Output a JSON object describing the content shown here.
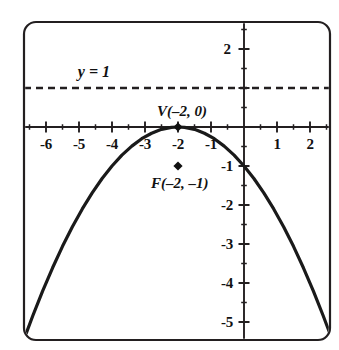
{
  "figure": {
    "title": "",
    "frame": {
      "x": 24,
      "y": 22,
      "width": 306,
      "height": 318,
      "radius": 12,
      "stroke": "#231f20",
      "stroke_width": 2.2
    },
    "background": "#ffffff"
  },
  "axes": {
    "origin_px": {
      "x": 244,
      "y": 127
    },
    "x_unit_px": 33,
    "y_unit_px": 39,
    "x_axis_label": "",
    "y_axis_label": "",
    "stroke": "#231f20"
  },
  "x_ticks": [
    {
      "value": -6,
      "label": "-6"
    },
    {
      "value": -5,
      "label": "-5"
    },
    {
      "value": -4,
      "label": "-4"
    },
    {
      "value": -3,
      "label": "-3"
    },
    {
      "value": -2,
      "label": "-2"
    },
    {
      "value": -1,
      "label": "-1"
    },
    {
      "value": 1,
      "label": "1"
    },
    {
      "value": 2,
      "label": "2"
    }
  ],
  "y_ticks": [
    {
      "value": 2,
      "label": "2"
    },
    {
      "value": 1,
      "label": ""
    },
    {
      "value": -1,
      "label": "-1"
    },
    {
      "value": -2,
      "label": "-2"
    },
    {
      "value": -3,
      "label": "-3"
    },
    {
      "value": -4,
      "label": "-4"
    },
    {
      "value": -5,
      "label": "-5"
    }
  ],
  "annotations": {
    "vertex_label": "V(–2, 0)",
    "focus_label": "F(–2, –1)",
    "directrix_label": "y = 1"
  },
  "chart_data": {
    "type": "line",
    "title": "",
    "xlabel": "",
    "ylabel": "",
    "xlim": [
      -6.7,
      2.6
    ],
    "ylim": [
      -5.5,
      2.4
    ],
    "grid": false,
    "legend": "none",
    "series": [
      {
        "name": "parabola",
        "equation": "y = -(x + 2)^2 / 4",
        "style": "solid",
        "color": "#1a1a1a",
        "width": 3.2,
        "x": [
          -6.7,
          -6.4,
          -6.1,
          -5.8,
          -5.5,
          -5.2,
          -4.9,
          -4.6,
          -4.3,
          -4.0,
          -3.7,
          -3.4,
          -3.1,
          -2.8,
          -2.5,
          -2.2,
          -2.0,
          -1.8,
          -1.5,
          -1.2,
          -0.9,
          -0.6,
          -0.3,
          0.0,
          0.3,
          0.6,
          0.9,
          1.2,
          1.5,
          1.8,
          2.1,
          2.4,
          2.6
        ],
        "y": [
          -5.52,
          -4.84,
          -4.2,
          -3.61,
          -3.06,
          -2.56,
          -2.1,
          -1.69,
          -1.32,
          -1.0,
          -0.72,
          -0.49,
          -0.3,
          -0.16,
          -0.06,
          -0.01,
          0.0,
          -0.01,
          -0.06,
          -0.16,
          -0.3,
          -0.49,
          -0.72,
          -1.0,
          -1.32,
          -1.69,
          -2.1,
          -2.56,
          -3.06,
          -3.61,
          -4.2,
          -4.84,
          -5.29
        ]
      },
      {
        "name": "directrix",
        "equation": "y = 1",
        "style": "dashed",
        "color": "#231f20",
        "width": 2.2,
        "x": [
          -6.7,
          2.6
        ],
        "y": [
          1,
          1
        ]
      }
    ],
    "points": [
      {
        "name": "vertex",
        "label": "V(–2, 0)",
        "x": -2,
        "y": 0,
        "marker": "diamond"
      },
      {
        "name": "focus",
        "label": "F(–2, –1)",
        "x": -2,
        "y": -1,
        "marker": "diamond"
      }
    ]
  }
}
